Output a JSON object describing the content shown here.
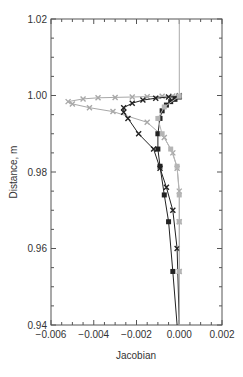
{
  "chart_data": {
    "type": "line",
    "title": "",
    "xlabel": "Jacobian",
    "ylabel": "Distance, m",
    "xlim": [
      -0.006,
      0.002
    ],
    "ylim": [
      0.94,
      1.02
    ],
    "x_ticks": [
      "-0.006",
      "-0.004",
      "-0.002",
      "0.000",
      "0.002"
    ],
    "y_ticks": [
      "0.94",
      "0.96",
      "0.98",
      "1.00",
      "1.02"
    ],
    "grid": false,
    "legend": null,
    "series": [
      {
        "name": "vertical reference",
        "color": "#aaaaaa",
        "marker": "none",
        "points": [
          [
            0.0,
            1.02
          ],
          [
            0.0,
            1.0
          ]
        ]
      },
      {
        "name": "series A (light gray, x markers)",
        "color": "#a8a8a8",
        "marker": "x",
        "points": [
          [
            0.0,
            1.0
          ],
          [
            -0.0003,
            0.9999
          ],
          [
            -0.0008,
            0.9998
          ],
          [
            -0.0015,
            0.9997
          ],
          [
            -0.0022,
            0.9996
          ],
          [
            -0.003,
            0.9995
          ],
          [
            -0.0038,
            0.9994
          ],
          [
            -0.0045,
            0.9991
          ],
          [
            -0.0052,
            0.9984
          ],
          [
            -0.005,
            0.9978
          ],
          [
            -0.0042,
            0.9968
          ],
          [
            -0.0031,
            0.9958
          ],
          [
            -0.0015,
            0.993
          ],
          [
            -0.0007,
            0.989
          ],
          [
            -0.0003,
            0.985
          ],
          [
            -0.0001,
            0.981
          ],
          [
            0.0,
            0.975
          ],
          [
            0.0,
            0.967
          ],
          [
            0.0,
            0.954
          ],
          [
            0.0,
            0.94
          ]
        ]
      },
      {
        "name": "series B (black, mid excursion)",
        "color": "#222222",
        "marker": "x",
        "points": [
          [
            0.0,
            0.9998
          ],
          [
            -0.0005,
            0.9996
          ],
          [
            -0.0011,
            0.9993
          ],
          [
            -0.0017,
            0.9988
          ],
          [
            -0.0022,
            0.998
          ],
          [
            -0.0026,
            0.9968
          ],
          [
            -0.0026,
            0.9956
          ],
          [
            -0.0024,
            0.994
          ],
          [
            -0.0019,
            0.99
          ],
          [
            -0.0012,
            0.986
          ],
          [
            -0.0009,
            0.981
          ],
          [
            -0.0006,
            0.976
          ],
          [
            -0.0003,
            0.97
          ],
          [
            -0.0001,
            0.96
          ],
          [
            0.0,
            0.94
          ]
        ]
      },
      {
        "name": "series C (black, near-zero)",
        "color": "#222222",
        "marker": "square",
        "points": [
          [
            0.0,
            0.9996
          ],
          [
            -0.0002,
            0.999
          ],
          [
            -0.0004,
            0.9984
          ],
          [
            -0.0006,
            0.9975
          ],
          [
            -0.0008,
            0.996
          ],
          [
            -0.0009,
            0.994
          ],
          [
            -0.001,
            0.99
          ],
          [
            -0.001,
            0.986
          ],
          [
            -0.0009,
            0.9815
          ],
          [
            -0.0007,
            0.974
          ],
          [
            -0.0005,
            0.967
          ],
          [
            -0.0003,
            0.954
          ],
          [
            -0.0001,
            0.94
          ]
        ]
      },
      {
        "name": "series D (light gray, squares)",
        "color": "#b5b5b5",
        "marker": "square",
        "points": [
          [
            0.0,
            0.9998
          ],
          [
            -0.0007,
            0.997
          ],
          [
            -0.001,
            0.994
          ],
          [
            -0.0008,
            0.99
          ],
          [
            -0.0004,
            0.986
          ],
          [
            -0.0001,
            0.9815
          ],
          [
            0.0,
            0.974
          ],
          [
            0.0,
            0.967
          ],
          [
            0.0,
            0.954
          ],
          [
            0.0,
            0.94
          ]
        ]
      }
    ]
  }
}
